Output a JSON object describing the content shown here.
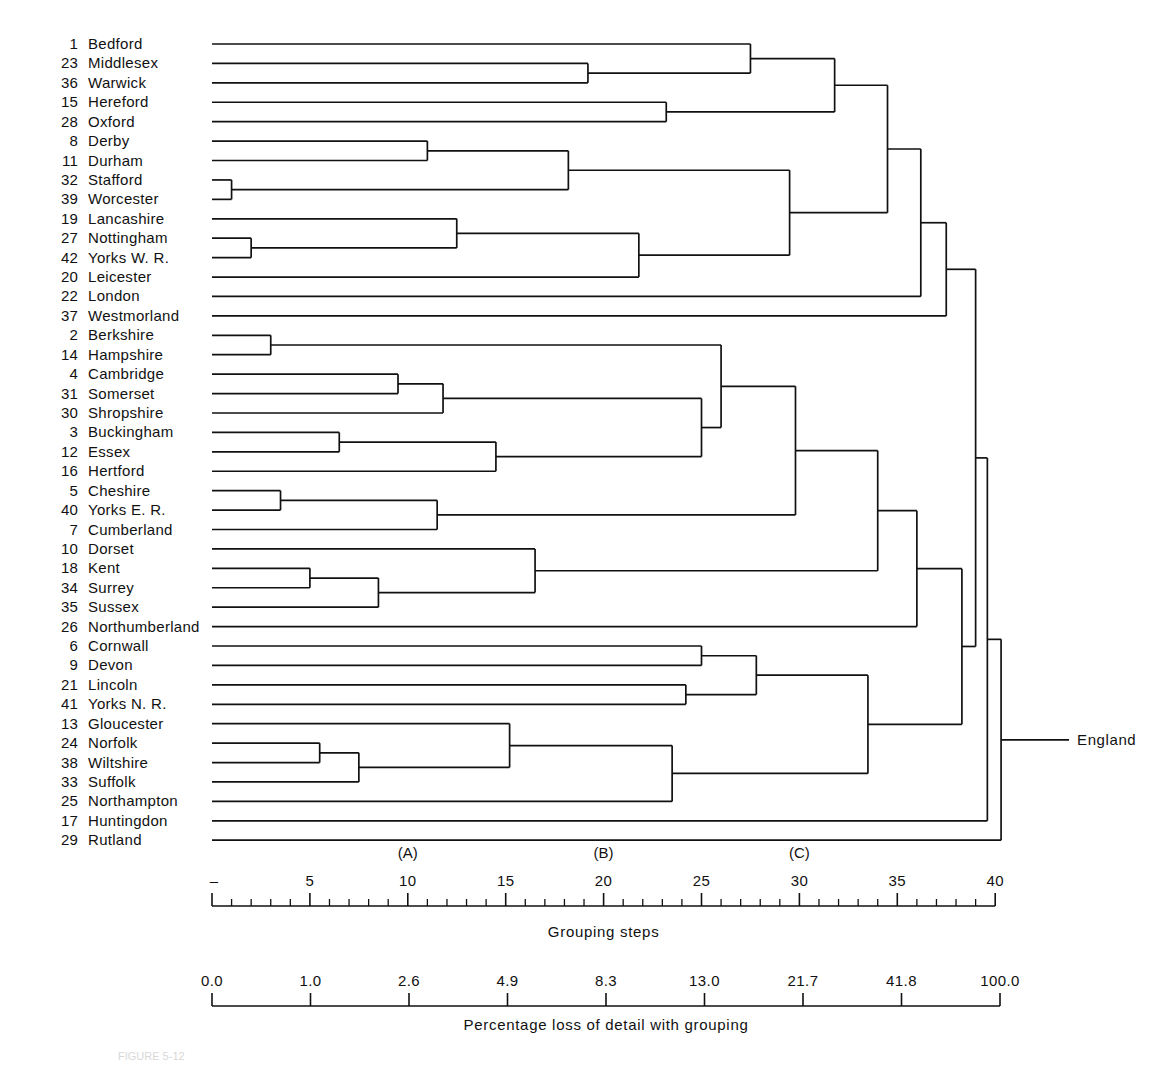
{
  "figure": {
    "root_label": "England",
    "caption": "FIGURE 5-12",
    "line_color": "#111111",
    "background": "#ffffff"
  },
  "leaves": [
    {
      "num": "1",
      "name": "Bedford"
    },
    {
      "num": "23",
      "name": "Middlesex"
    },
    {
      "num": "36",
      "name": "Warwick"
    },
    {
      "num": "15",
      "name": "Hereford"
    },
    {
      "num": "28",
      "name": "Oxford"
    },
    {
      "num": "8",
      "name": "Derby"
    },
    {
      "num": "11",
      "name": "Durham"
    },
    {
      "num": "32",
      "name": "Stafford"
    },
    {
      "num": "39",
      "name": "Worcester"
    },
    {
      "num": "19",
      "name": "Lancashire"
    },
    {
      "num": "27",
      "name": "Nottingham"
    },
    {
      "num": "42",
      "name": "Yorks W. R."
    },
    {
      "num": "20",
      "name": "Leicester"
    },
    {
      "num": "22",
      "name": "London"
    },
    {
      "num": "37",
      "name": "Westmorland"
    },
    {
      "num": "2",
      "name": "Berkshire"
    },
    {
      "num": "14",
      "name": "Hampshire"
    },
    {
      "num": "4",
      "name": "Cambridge"
    },
    {
      "num": "31",
      "name": "Somerset"
    },
    {
      "num": "30",
      "name": "Shropshire"
    },
    {
      "num": "3",
      "name": "Buckingham"
    },
    {
      "num": "12",
      "name": "Essex"
    },
    {
      "num": "16",
      "name": "Hertford"
    },
    {
      "num": "5",
      "name": "Cheshire"
    },
    {
      "num": "40",
      "name": "Yorks E. R."
    },
    {
      "num": "7",
      "name": "Cumberland"
    },
    {
      "num": "10",
      "name": "Dorset"
    },
    {
      "num": "18",
      "name": "Kent"
    },
    {
      "num": "34",
      "name": "Surrey"
    },
    {
      "num": "35",
      "name": "Sussex"
    },
    {
      "num": "26",
      "name": "Northumberland"
    },
    {
      "num": "6",
      "name": "Cornwall"
    },
    {
      "num": "9",
      "name": "Devon"
    },
    {
      "num": "21",
      "name": "Lincoln"
    },
    {
      "num": "41",
      "name": "Yorks N. R."
    },
    {
      "num": "13",
      "name": "Gloucester"
    },
    {
      "num": "24",
      "name": "Norfolk"
    },
    {
      "num": "38",
      "name": "Wiltshire"
    },
    {
      "num": "33",
      "name": "Suffolk"
    },
    {
      "num": "25",
      "name": "Northampton"
    },
    {
      "num": "17",
      "name": "Huntingdon"
    },
    {
      "num": "29",
      "name": "Rutland"
    }
  ],
  "chart_data": {
    "type": "dendrogram",
    "title": "",
    "root_label": "England",
    "leaf_labels": [
      "1 Bedford",
      "23 Middlesex",
      "36 Warwick",
      "15 Hereford",
      "28 Oxford",
      "8 Derby",
      "11 Durham",
      "32 Stafford",
      "39 Worcester",
      "19 Lancashire",
      "27 Nottingham",
      "42 Yorks W. R.",
      "20 Leicester",
      "22 London",
      "37 Westmorland",
      "2 Berkshire",
      "14 Hampshire",
      "4 Cambridge",
      "31 Somerset",
      "30 Shropshire",
      "3 Buckingham",
      "12 Essex",
      "16 Hertford",
      "5 Cheshire",
      "40 Yorks E. R.",
      "7 Cumberland",
      "10 Dorset",
      "18 Kent",
      "34 Surrey",
      "35 Sussex",
      "26 Northumberland",
      "6 Cornwall",
      "9 Devon",
      "21 Lincoln",
      "41 Yorks N. R.",
      "13 Gloucester",
      "24 Norfolk",
      "38 Wiltshire",
      "33 Suffolk",
      "25 Northampton",
      "17 Huntingdon",
      "29 Rutland"
    ],
    "xlabel": "Grouping steps",
    "xlabel_secondary": "Percentage loss of detail with grouping",
    "xlim": [
      0,
      41
    ],
    "merges": [
      {
        "id": "m_stafford_worcester",
        "members": [
          7,
          8
        ],
        "step": 1.0
      },
      {
        "id": "m_nott_yorkswr",
        "members": [
          10,
          11
        ],
        "step": 2.0
      },
      {
        "id": "m_berks_hants",
        "members": [
          15,
          16
        ],
        "step": 3.0
      },
      {
        "id": "m_cheshire_yorkser",
        "members": [
          23,
          24
        ],
        "step": 3.5
      },
      {
        "id": "m_kent_surrey",
        "members": [
          27,
          28
        ],
        "step": 5.0
      },
      {
        "id": "m_norfolk_wilts",
        "members": [
          36,
          37
        ],
        "step": 5.5
      },
      {
        "id": "m_bucks_essex",
        "members": [
          20,
          21
        ],
        "step": 6.5
      },
      {
        "id": "m_nw_suffolk",
        "members": [
          "m_norfolk_wilts",
          38
        ],
        "step": 7.5
      },
      {
        "id": "m_ks_sussex",
        "members": [
          "m_kent_surrey",
          29
        ],
        "step": 8.5
      },
      {
        "id": "m_derby_durham",
        "members": [
          5,
          6
        ],
        "step": 11.0
      },
      {
        "id": "m_cam_somerset",
        "members": [
          17,
          18
        ],
        "step": 9.5
      },
      {
        "id": "m_lancs_ny",
        "members": [
          9,
          "m_nott_yorkswr"
        ],
        "step": 12.5
      },
      {
        "id": "m_cy_cumberland",
        "members": [
          "m_cheshire_yorkser",
          25
        ],
        "step": 11.5
      },
      {
        "id": "m_cs_shropshire",
        "members": [
          "m_cam_somerset",
          19
        ],
        "step": 11.8
      },
      {
        "id": "m_be_hertford",
        "members": [
          "m_bucks_essex",
          22
        ],
        "step": 14.5
      },
      {
        "id": "m_gloucester_nws",
        "members": [
          35,
          "m_nw_suffolk"
        ],
        "step": 15.2
      },
      {
        "id": "m_dorset_kss",
        "members": [
          26,
          "m_ks_sussex"
        ],
        "step": 16.5
      },
      {
        "id": "m_dd_sw",
        "members": [
          "m_derby_durham",
          "m_stafford_worcester"
        ],
        "step": 18.2
      },
      {
        "id": "m_middlesex_warwick",
        "members": [
          1,
          2
        ],
        "step": 19.2
      },
      {
        "id": "m_lny_leicester",
        "members": [
          "m_lancs_ny",
          12
        ],
        "step": 21.8
      },
      {
        "id": "m_gnws_northampton",
        "members": [
          "m_gloucester_nws",
          39
        ],
        "step": 23.5
      },
      {
        "id": "m_hereford_oxford",
        "members": [
          3,
          4
        ],
        "step": 23.2
      },
      {
        "id": "m_cornwall_devon",
        "members": [
          31,
          32
        ],
        "step": 25.0
      },
      {
        "id": "m_css_behert",
        "members": [
          "m_cs_shropshire",
          "m_be_hertford"
        ],
        "step": 25.0
      },
      {
        "id": "m_lincoln_yorksnr",
        "members": [
          33,
          34
        ],
        "step": 24.2
      },
      {
        "id": "m_bh_berkshants",
        "members": [
          "m_css_behert",
          "m_berks_hants"
        ],
        "step": 26.0
      },
      {
        "id": "m_bedford_mw",
        "members": [
          0,
          "m_middlesex_warwick"
        ],
        "step": 27.5
      },
      {
        "id": "m_cd_ly",
        "members": [
          "m_cornwall_devon",
          "m_lincoln_yorksnr"
        ],
        "step": 27.8
      },
      {
        "id": "m_ddsw_lnyl",
        "members": [
          "m_dd_sw",
          "m_lny_leicester"
        ],
        "step": 29.5
      },
      {
        "id": "m_bhb_cyc",
        "members": [
          "m_bh_berkshants",
          "m_cy_cumberland"
        ],
        "step": 29.8
      },
      {
        "id": "m_bmw_ho",
        "members": [
          "m_bedford_mw",
          "m_hereford_oxford"
        ],
        "step": 31.8
      },
      {
        "id": "m_cdly_gn",
        "members": [
          "m_cd_ly",
          "m_gnws_northampton"
        ],
        "step": 33.5
      },
      {
        "id": "m_bhc_dk",
        "members": [
          "m_bhb_cyc",
          "m_dorset_kss"
        ],
        "step": 34.0
      },
      {
        "id": "m_bmwho_ddsw",
        "members": [
          "m_bmw_ho",
          "m_ddsw_lnyl"
        ],
        "step": 34.5
      },
      {
        "id": "m_top_london",
        "members": [
          "m_bmwho_ddsw",
          13
        ],
        "step": 36.2
      },
      {
        "id": "m_north_west",
        "members": [
          "m_bhc_dk",
          30
        ],
        "step": 36.0
      },
      {
        "id": "m_upper",
        "members": [
          "m_top_london",
          14
        ],
        "step": 37.5
      },
      {
        "id": "m_mid",
        "members": [
          "m_north_west",
          "m_cdly_gn"
        ],
        "step": 38.3
      },
      {
        "id": "m_upper_mid",
        "members": [
          "m_upper",
          "m_mid"
        ],
        "step": 39.0
      },
      {
        "id": "m_huntingdon",
        "members": [
          "m_upper_mid",
          40
        ],
        "step": 39.6
      },
      {
        "id": "m_england",
        "members": [
          "m_huntingdon",
          41
        ],
        "step": 40.3
      }
    ]
  },
  "axis_primary": {
    "title": "Grouping steps",
    "zero_label": "–",
    "ticks": [
      {
        "value": 0,
        "label": ""
      },
      {
        "value": 5,
        "label": "5"
      },
      {
        "value": 10,
        "label": "10"
      },
      {
        "value": 15,
        "label": "15"
      },
      {
        "value": 20,
        "label": "20"
      },
      {
        "value": 25,
        "label": "25"
      },
      {
        "value": 30,
        "label": "30"
      },
      {
        "value": 35,
        "label": "35"
      },
      {
        "value": 40,
        "label": "40"
      }
    ],
    "markers": [
      {
        "label": "(A)",
        "value": 10
      },
      {
        "label": "(B)",
        "value": 20
      },
      {
        "label": "(C)",
        "value": 30
      }
    ]
  },
  "axis_secondary": {
    "title": "Percentage loss of detail with grouping",
    "ticks": [
      "0.0",
      "1.0",
      "2.6",
      "4.9",
      "8.3",
      "13.0",
      "21.7",
      "41.8",
      "100.0"
    ]
  }
}
